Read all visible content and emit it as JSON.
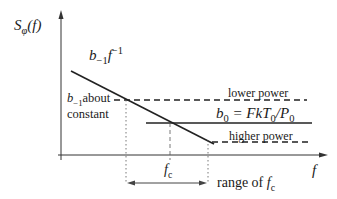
{
  "diagram": {
    "y_axis_label": {
      "main": "S",
      "sub": "φ",
      "arg": "(f)"
    },
    "x_axis_label": "f",
    "slope_label": {
      "coef": "b",
      "coef_sub": "−1",
      "var": "f",
      "var_sup": "−1"
    },
    "b_minus1_note": {
      "coef": "b",
      "coef_sub": "−1",
      "line1_rest": "about",
      "line2": "constant"
    },
    "lower_power_label": "lower power",
    "higher_power_label": "higher power",
    "b0_label": {
      "lhs": "b",
      "lhs_sub": "0",
      "eq": "= FkT",
      "t_sub": "0",
      "slash": "/P",
      "p_sub": "0"
    },
    "fc_label": {
      "main": "f",
      "sub": "c"
    },
    "range_label": {
      "text": "range of ",
      "main": "f",
      "sub": "c"
    }
  }
}
